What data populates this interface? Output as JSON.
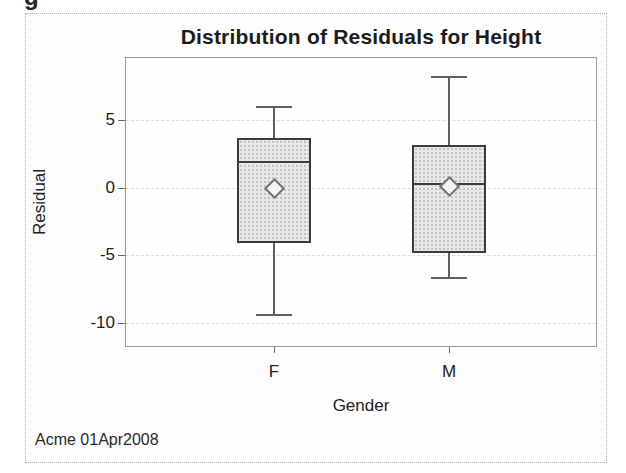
{
  "page": {
    "cropped_heading_fragment": "g"
  },
  "chart_data": {
    "type": "boxplot",
    "title": "Distribution of Residuals for Height",
    "xlabel": "Gender",
    "ylabel": "Residual",
    "footnote": "Acme 01Apr2008",
    "categories": [
      "F",
      "M"
    ],
    "yticks": [
      5,
      0,
      -5,
      -10
    ],
    "ylim": [
      -11.8,
      9.7
    ],
    "grid": true,
    "legend": "none",
    "series": [
      {
        "category": "F",
        "whisker_low": -9.4,
        "q1": -4.1,
        "median": 1.9,
        "q3": 3.7,
        "whisker_high": 6.0,
        "mean": 0.0
      },
      {
        "category": "M",
        "whisker_low": -6.7,
        "q1": -4.8,
        "median": 0.3,
        "q3": 3.2,
        "whisker_high": 8.2,
        "mean": 0.1
      }
    ],
    "colors": {
      "box_fill": "#e8e8e8",
      "box_dot": "#c2c2c2",
      "box_border": "#3b3b3b",
      "median": "#3b3b3b",
      "whisker": "#606060",
      "mean_marker_stroke": "#6f6f6f",
      "mean_marker_fill": "#f4f4f4",
      "gridline": "#dcdcdc",
      "frame": "#9a9a9a",
      "text": "#1e1e1e"
    }
  }
}
